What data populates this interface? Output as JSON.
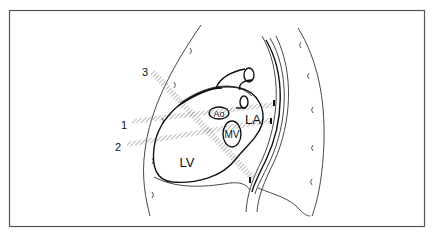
{
  "diagram": {
    "structures": [
      {
        "id": "ao",
        "label": "Ao"
      },
      {
        "id": "la",
        "label": "LA"
      },
      {
        "id": "mv",
        "label": "MV"
      },
      {
        "id": "lv",
        "label": "LV"
      }
    ],
    "beams": [
      {
        "id": "beam-1",
        "label": "1"
      },
      {
        "id": "beam-2",
        "label": "2"
      },
      {
        "id": "beam-3",
        "label": "3"
      }
    ],
    "colors": {
      "line": "#111111",
      "frame": "#555555",
      "beam_hatch": "#9a9a9a"
    }
  }
}
